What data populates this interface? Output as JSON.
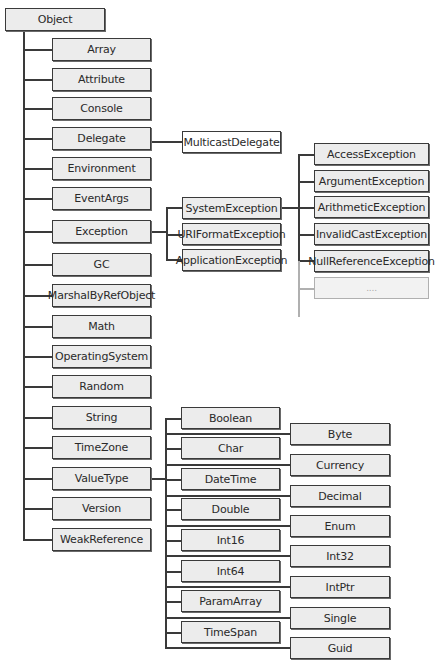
{
  "title": "Object",
  "colors": {
    "box_fill": "#ececec",
    "box_border": "#3a3a3a",
    "line": "#3a3a3a",
    "faded": "#b0b0b0"
  },
  "nodes": [
    {
      "id": "object",
      "label": "Object",
      "x": 5,
      "y": 8,
      "w": 100,
      "h": 23
    },
    {
      "id": "array",
      "label": "Array",
      "x": 52,
      "y": 38,
      "w": 99,
      "h": 23
    },
    {
      "id": "attribute",
      "label": "Attribute",
      "x": 52,
      "y": 68,
      "w": 99,
      "h": 23
    },
    {
      "id": "console",
      "label": "Console",
      "x": 52,
      "y": 97,
      "w": 99,
      "h": 23
    },
    {
      "id": "delegate",
      "label": "Delegate",
      "x": 52,
      "y": 127,
      "w": 99,
      "h": 23
    },
    {
      "id": "environment",
      "label": "Environment",
      "x": 52,
      "y": 157,
      "w": 99,
      "h": 23
    },
    {
      "id": "eventargs",
      "label": "EventArgs",
      "x": 52,
      "y": 187,
      "w": 99,
      "h": 23
    },
    {
      "id": "exception",
      "label": "Exception",
      "x": 52,
      "y": 220,
      "w": 99,
      "h": 23
    },
    {
      "id": "gc",
      "label": "GC",
      "x": 52,
      "y": 253,
      "w": 99,
      "h": 23
    },
    {
      "id": "marshalbyrefobject",
      "label": "MarshalByRefObject",
      "x": 52,
      "y": 284,
      "w": 99,
      "h": 23
    },
    {
      "id": "math",
      "label": "Math",
      "x": 52,
      "y": 315,
      "w": 99,
      "h": 23
    },
    {
      "id": "operatingsystem",
      "label": "OperatingSystem",
      "x": 52,
      "y": 345,
      "w": 99,
      "h": 23
    },
    {
      "id": "random",
      "label": "Random",
      "x": 52,
      "y": 375,
      "w": 99,
      "h": 23
    },
    {
      "id": "string",
      "label": "String",
      "x": 52,
      "y": 406,
      "w": 99,
      "h": 23
    },
    {
      "id": "timezone",
      "label": "TimeZone",
      "x": 52,
      "y": 436,
      "w": 99,
      "h": 23
    },
    {
      "id": "valuetype",
      "label": "ValueType",
      "x": 52,
      "y": 467,
      "w": 99,
      "h": 23
    },
    {
      "id": "version",
      "label": "Version",
      "x": 52,
      "y": 497,
      "w": 99,
      "h": 23
    },
    {
      "id": "weakreference",
      "label": "WeakReference",
      "x": 52,
      "y": 528,
      "w": 99,
      "h": 23
    },
    {
      "id": "multicastdelegate",
      "label": "MulticastDelegate",
      "x": 182,
      "y": 131,
      "w": 99,
      "h": 22,
      "style": "white"
    },
    {
      "id": "systemexception",
      "label": "SystemException",
      "x": 182,
      "y": 197,
      "w": 99,
      "h": 22
    },
    {
      "id": "uriformatexception",
      "label": "URIFormatException",
      "x": 182,
      "y": 223,
      "w": 99,
      "h": 22
    },
    {
      "id": "applicationexception",
      "label": "ApplicationException",
      "x": 182,
      "y": 249,
      "w": 99,
      "h": 22
    },
    {
      "id": "accessexception",
      "label": "AccessException",
      "x": 314,
      "y": 143,
      "w": 115,
      "h": 22
    },
    {
      "id": "argumentexception",
      "label": "ArgumentException",
      "x": 314,
      "y": 170,
      "w": 115,
      "h": 22
    },
    {
      "id": "arithmeticexception",
      "label": "ArithmeticException",
      "x": 314,
      "y": 196,
      "w": 115,
      "h": 22
    },
    {
      "id": "invalidcastexception",
      "label": "InvalidCastException",
      "x": 314,
      "y": 223,
      "w": 115,
      "h": 22
    },
    {
      "id": "nullreferenceexception",
      "label": "NullReferenceException",
      "x": 314,
      "y": 250,
      "w": 115,
      "h": 22
    },
    {
      "id": "more",
      "label": "....",
      "x": 314,
      "y": 277,
      "w": 115,
      "h": 22,
      "style": "faded"
    },
    {
      "id": "boolean",
      "label": "Boolean",
      "x": 181,
      "y": 407,
      "w": 99,
      "h": 22
    },
    {
      "id": "char",
      "label": "Char",
      "x": 181,
      "y": 437,
      "w": 99,
      "h": 22
    },
    {
      "id": "datetime",
      "label": "DateTime",
      "x": 181,
      "y": 468,
      "w": 99,
      "h": 22
    },
    {
      "id": "double",
      "label": "Double",
      "x": 181,
      "y": 498,
      "w": 99,
      "h": 22
    },
    {
      "id": "int16",
      "label": "Int16",
      "x": 181,
      "y": 529,
      "w": 99,
      "h": 22
    },
    {
      "id": "int64",
      "label": "Int64",
      "x": 181,
      "y": 560,
      "w": 99,
      "h": 22
    },
    {
      "id": "paramarray",
      "label": "ParamArray",
      "x": 181,
      "y": 590,
      "w": 99,
      "h": 22
    },
    {
      "id": "timespan",
      "label": "TimeSpan",
      "x": 181,
      "y": 621,
      "w": 99,
      "h": 22
    },
    {
      "id": "byte",
      "label": "Byte",
      "x": 290,
      "y": 423,
      "w": 100,
      "h": 22
    },
    {
      "id": "currency",
      "label": "Currency",
      "x": 290,
      "y": 454,
      "w": 100,
      "h": 22
    },
    {
      "id": "decimal",
      "label": "Decimal",
      "x": 290,
      "y": 485,
      "w": 100,
      "h": 22
    },
    {
      "id": "enum",
      "label": "Enum",
      "x": 290,
      "y": 515,
      "w": 100,
      "h": 22
    },
    {
      "id": "int32",
      "label": "Int32",
      "x": 290,
      "y": 545,
      "w": 100,
      "h": 22
    },
    {
      "id": "intptr",
      "label": "IntPtr",
      "x": 290,
      "y": 576,
      "w": 100,
      "h": 22
    },
    {
      "id": "single",
      "label": "Single",
      "x": 290,
      "y": 607,
      "w": 100,
      "h": 22
    },
    {
      "id": "guid",
      "label": "Guid",
      "x": 290,
      "y": 637,
      "w": 100,
      "h": 22
    }
  ],
  "lines": [
    {
      "x": 23,
      "y": 31,
      "w": 1.5,
      "h": 509
    },
    {
      "x": 23,
      "y": 49,
      "w": 29,
      "h": 1.5
    },
    {
      "x": 23,
      "y": 79,
      "w": 29,
      "h": 1.5
    },
    {
      "x": 23,
      "y": 108,
      "w": 29,
      "h": 1.5
    },
    {
      "x": 23,
      "y": 138,
      "w": 29,
      "h": 1.5
    },
    {
      "x": 23,
      "y": 168,
      "w": 29,
      "h": 1.5
    },
    {
      "x": 23,
      "y": 198,
      "w": 29,
      "h": 1.5
    },
    {
      "x": 23,
      "y": 231,
      "w": 29,
      "h": 1.5
    },
    {
      "x": 23,
      "y": 264,
      "w": 29,
      "h": 1.5
    },
    {
      "x": 23,
      "y": 295,
      "w": 29,
      "h": 1.5
    },
    {
      "x": 23,
      "y": 326,
      "w": 29,
      "h": 1.5
    },
    {
      "x": 23,
      "y": 356,
      "w": 29,
      "h": 1.5
    },
    {
      "x": 23,
      "y": 386,
      "w": 29,
      "h": 1.5
    },
    {
      "x": 23,
      "y": 417,
      "w": 29,
      "h": 1.5
    },
    {
      "x": 23,
      "y": 447,
      "w": 29,
      "h": 1.5
    },
    {
      "x": 23,
      "y": 478,
      "w": 29,
      "h": 1.5
    },
    {
      "x": 23,
      "y": 508,
      "w": 29,
      "h": 1.5
    },
    {
      "x": 23,
      "y": 539,
      "w": 29,
      "h": 1.5
    },
    {
      "x": 151,
      "y": 141,
      "w": 31,
      "h": 1.5
    },
    {
      "x": 151,
      "y": 231,
      "w": 15,
      "h": 1.5
    },
    {
      "x": 166,
      "y": 207,
      "w": 1.5,
      "h": 53
    },
    {
      "x": 166,
      "y": 207,
      "w": 16,
      "h": 1.5
    },
    {
      "x": 166,
      "y": 234,
      "w": 16,
      "h": 1.5
    },
    {
      "x": 166,
      "y": 259,
      "w": 16,
      "h": 1.5
    },
    {
      "x": 281,
      "y": 207,
      "w": 33,
      "h": 1.5
    },
    {
      "x": 298,
      "y": 154,
      "w": 1.5,
      "h": 107
    },
    {
      "x": 298,
      "y": 154,
      "w": 16,
      "h": 1.5
    },
    {
      "x": 298,
      "y": 181,
      "w": 16,
      "h": 1.5
    },
    {
      "x": 298,
      "y": 234,
      "w": 16,
      "h": 1.5
    },
    {
      "x": 298,
      "y": 260,
      "w": 16,
      "h": 1.5
    },
    {
      "x": 298,
      "y": 261,
      "w": 1.5,
      "h": 56,
      "style": "faded"
    },
    {
      "x": 298,
      "y": 288,
      "w": 16,
      "h": 1.5,
      "style": "faded"
    },
    {
      "x": 151,
      "y": 478,
      "w": 15,
      "h": 1.5
    },
    {
      "x": 165,
      "y": 418,
      "w": 1.5,
      "h": 230
    },
    {
      "x": 165,
      "y": 418,
      "w": 16,
      "h": 1.5
    },
    {
      "x": 165,
      "y": 448,
      "w": 16,
      "h": 1.5
    },
    {
      "x": 165,
      "y": 479,
      "w": 16,
      "h": 1.5
    },
    {
      "x": 165,
      "y": 509,
      "w": 16,
      "h": 1.5
    },
    {
      "x": 165,
      "y": 540,
      "w": 16,
      "h": 1.5
    },
    {
      "x": 165,
      "y": 571,
      "w": 16,
      "h": 1.5
    },
    {
      "x": 165,
      "y": 601,
      "w": 16,
      "h": 1.5
    },
    {
      "x": 165,
      "y": 632,
      "w": 16,
      "h": 1.5
    },
    {
      "x": 165,
      "y": 433,
      "w": 125,
      "h": 1.5
    },
    {
      "x": 165,
      "y": 464,
      "w": 125,
      "h": 1.5
    },
    {
      "x": 165,
      "y": 495,
      "w": 125,
      "h": 1.5
    },
    {
      "x": 165,
      "y": 525,
      "w": 125,
      "h": 1.5
    },
    {
      "x": 165,
      "y": 555,
      "w": 125,
      "h": 1.5
    },
    {
      "x": 165,
      "y": 586,
      "w": 125,
      "h": 1.5
    },
    {
      "x": 165,
      "y": 617,
      "w": 125,
      "h": 1.5
    },
    {
      "x": 165,
      "y": 647,
      "w": 125,
      "h": 1.5
    }
  ]
}
